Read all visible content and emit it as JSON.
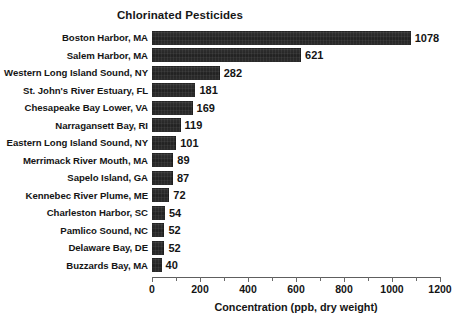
{
  "chart_data": {
    "type": "bar",
    "orientation": "horizontal",
    "title": "Chlorinated Pesticides",
    "xlabel": "Concentration (ppb, dry weight)",
    "ylabel": "",
    "xlim": [
      0,
      1200
    ],
    "xticks": [
      0,
      200,
      400,
      600,
      800,
      1000,
      1200
    ],
    "xtick_labels": [
      "0",
      "200",
      "400",
      "600",
      "800",
      "1000",
      "1200"
    ],
    "minor_tick_interval": 100,
    "grid": false,
    "legend": false,
    "bar_color": "#2b2b2b",
    "background_color": "#ffffff",
    "categories": [
      "Boston Harbor, MA",
      "Salem Harbor, MA",
      "Western Long Island Sound, NY",
      "St. John's River Estuary, FL",
      "Chesapeake Bay Lower, VA",
      "Narragansett Bay, RI",
      "Eastern Long Island Sound, NY",
      "Merrimack River Mouth, MA",
      "Sapelo Island, GA",
      "Kennebec River Plume, ME",
      "Charleston Harbor, SC",
      "Pamlico Sound, NC",
      "Delaware Bay, DE",
      "Buzzards Bay, MA"
    ],
    "values": [
      1078,
      621,
      282,
      181,
      169,
      119,
      101,
      89,
      87,
      72,
      54,
      52,
      52,
      40
    ],
    "value_labels": [
      "1078",
      "621",
      "282",
      "181",
      "169",
      "119",
      "101",
      "89",
      "87",
      "72",
      "54",
      "52",
      "52",
      "40"
    ]
  }
}
